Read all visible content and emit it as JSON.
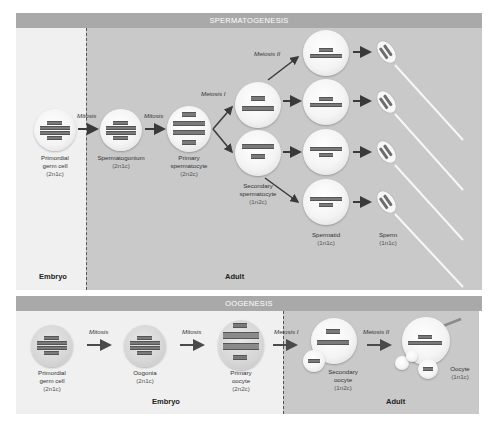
{
  "spermatogenesis": {
    "title": "SPERMATOGENESIS",
    "zones": [
      {
        "label": "Embryo"
      },
      {
        "label": "Adult"
      }
    ],
    "steps": [
      "Mitosis",
      "Mitosis",
      "Meiosis I",
      "Meiosis II"
    ],
    "stages": [
      {
        "name": "Primordial germ cell",
        "ploidy": "(2n1c)"
      },
      {
        "name": "Spermatogonium",
        "ploidy": "(2n1c)"
      },
      {
        "name": "Primary spermatocyte",
        "ploidy": "(2n2c)"
      },
      {
        "name": "Secondary spermatocyte",
        "ploidy": "(1n2c)"
      },
      {
        "name": "Spermatid",
        "ploidy": "(1n1c)"
      },
      {
        "name": "Sperm",
        "ploidy": "(1n1c)"
      }
    ]
  },
  "oogenesis": {
    "title": "OOGENESIS",
    "zones": [
      {
        "label": "Embryo"
      },
      {
        "label": "Adult"
      }
    ],
    "steps": [
      "Mitosis",
      "Mitosis",
      "Meiosis I",
      "Meiosis II"
    ],
    "stages": [
      {
        "name": "Primordial germ cell",
        "ploidy": "(2n1c)"
      },
      {
        "name": "Oogonia",
        "ploidy": "(2n1c)"
      },
      {
        "name": "Primary oocyte",
        "ploidy": "(2n2c)"
      },
      {
        "name": "Secondary oocyte",
        "ploidy": "(1n2c)"
      },
      {
        "name": "Oocyte",
        "ploidy": "(1n1c)"
      }
    ]
  },
  "colors": {
    "header": "#a9a9a9",
    "embryo_bg": "#f0f0f0",
    "adult_bg": "#c9c9c9"
  }
}
